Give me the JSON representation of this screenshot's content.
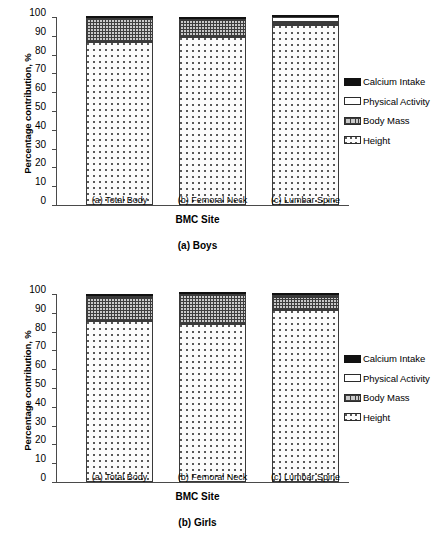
{
  "chart_data": [
    {
      "type": "bar",
      "stacked": true,
      "title": "(a) Boys",
      "xlabel": "BMC Site",
      "ylabel": "Percentage contribution, %",
      "ylim": [
        0,
        100
      ],
      "yticks": [
        0,
        10,
        20,
        30,
        40,
        50,
        60,
        70,
        80,
        90,
        100
      ],
      "grid": false,
      "legend_position": "right",
      "categories": [
        "(a) Total Body",
        "(b) Femoral Neck",
        "(c) Lumbar Spine"
      ],
      "series": [
        {
          "name": "Height",
          "values": [
            86.5,
            89.5,
            95.8
          ]
        },
        {
          "name": "Body Mass",
          "values": [
            12.8,
            9.0,
            1.7
          ]
        },
        {
          "name": "Physical Activity",
          "values": [
            0.3,
            0.4,
            2.3
          ]
        },
        {
          "name": "Calcium Intake",
          "values": [
            0.4,
            1.1,
            0.2
          ]
        }
      ]
    },
    {
      "type": "bar",
      "stacked": true,
      "title": "(b) Girls",
      "xlabel": "BMC Site",
      "ylabel": "Percentage contribution, %",
      "ylim": [
        0,
        100
      ],
      "yticks": [
        0,
        10,
        20,
        30,
        40,
        50,
        60,
        70,
        80,
        90,
        100
      ],
      "grid": false,
      "legend_position": "right",
      "categories": [
        "(a) Total Body",
        "(b) Femoral Neck",
        "(c) Lumbar Spine"
      ],
      "series": [
        {
          "name": "Height",
          "values": [
            85.5,
            84.0,
            91.7
          ]
        },
        {
          "name": "Body Mass",
          "values": [
            12.5,
            15.5,
            6.8
          ]
        },
        {
          "name": "Physical Activity",
          "values": [
            1.2,
            0.3,
            1.0
          ]
        },
        {
          "name": "Calcium Intake",
          "values": [
            0.8,
            0.2,
            0.5
          ]
        }
      ]
    }
  ],
  "colors": {
    "calcium_intake": "#111111",
    "physical_activity": "#ffffff",
    "body_mass": "#c9c9c9",
    "height": "#fcfcfc",
    "axis": "#4a4a4a",
    "outline": "#3a3a3a"
  },
  "charts": [
    {
      "ylabel": "Percentage contribution, %",
      "xlabel": "BMC Site",
      "caption": "(a) Boys",
      "yticks": [
        "100",
        "90",
        "80",
        "70",
        "60",
        "50",
        "40",
        "30",
        "20",
        "10",
        "0"
      ],
      "categories": [
        "(a) Total Body",
        "(b) Femoral Neck",
        "(c) Lumbar Spine"
      ],
      "legend": [
        {
          "label": "Calcium Intake",
          "key": "calcium"
        },
        {
          "label": "Physical Activity",
          "key": "activity"
        },
        {
          "label": "Body Mass",
          "key": "bodymass"
        },
        {
          "label": "Height",
          "key": "hgt"
        }
      ]
    },
    {
      "ylabel": "Percentage contribution, %",
      "xlabel": "BMC Site",
      "caption": "(b) Girls",
      "yticks": [
        "100",
        "90",
        "80",
        "70",
        "60",
        "50",
        "40",
        "30",
        "20",
        "10",
        "0"
      ],
      "categories": [
        "(a) Total Body",
        "(b) Femoral Neck",
        "(c) Lumbar Spine"
      ],
      "legend": [
        {
          "label": "Calcium Intake",
          "key": "calcium"
        },
        {
          "label": "Physical Activity",
          "key": "activity"
        },
        {
          "label": "Body Mass",
          "key": "bodymass"
        },
        {
          "label": "Height",
          "key": "hgt"
        }
      ]
    }
  ]
}
